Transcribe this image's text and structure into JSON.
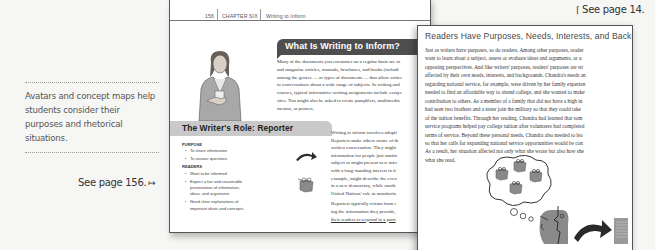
{
  "margin_notes": {
    "caption": "Avatars and concept maps help students consider their purposes and rhetorical situations.",
    "see_page_156": "See page 156.",
    "see_page_156_arrow": "↦",
    "see_page_14": "See page 14.",
    "see_page_14_arrow": "⌈"
  },
  "page156": {
    "running_head": {
      "page_number": "156",
      "chapter": "CHAPTER SIX",
      "title": "Writing to Inform"
    },
    "section_heading": "What Is Writing to Inform?",
    "intro_lines": [
      "Many of the documents you encounter on a regular basis are in",
      "and magazine articles, manuals, brochures, and books (includi",
      "among the genres — or types of documents — that allow writer",
      "to conversations about a wide range of subjects. In writing and",
      "courses, typical informative-writing assignments include essays",
      "sites. You might also be asked to create pamphlets, multimedia",
      "memos, or posters."
    ],
    "role_box": {
      "title": "The Writer's Role: Reporter",
      "purpose_heading": "PURPOSE",
      "purpose_items": [
        "To share information",
        "To answer questions"
      ],
      "readers_heading": "READERS",
      "readers_items": [
        "Want to be informed",
        "Expect a fair and reasonable presentation of information, ideas, and arguments",
        "Need clear explanations of important ideas and concepts"
      ]
    },
    "right_column": {
      "para1": [
        "Writing to inform involves adopti",
        "Reporters make others aware of th",
        "written conversation. They might",
        "information for people just startin",
        "subject or might present new info",
        "with a long-standing interest in it",
        "example, might describe the even",
        "in a new democracy, while anoth",
        "United Nations' role in monitorin"
      ],
      "para2": [
        "Reporters typically refrain from i",
        "ing the information they provide,",
        "their readers to respond in a parti"
      ]
    }
  },
  "overlay_page": {
    "heading": "Readers Have Purposes, Needs, Interests, and Backg",
    "body_lines": [
      "Just as writers have purposes, so do readers. Among other purposes, reader",
      "want to learn about a subject, assess or evaluate ideas and arguments, or u",
      "opposing perspectives. And like writers' purposes, readers' purposes are str",
      "affected by their own needs, interests, and backgrounds. Chandra's needs an",
      "regarding national service, for example, were driven by her family experien",
      "needed to find an affordable way to attend college, and she wanted to make",
      "contribution to others. As a member of a family that did not have a high in",
      "had seen two brothers and a sister join the military so that they could take",
      "of the tuition benefits. Through her reading, Chandra had learned that som",
      "service programs helped pay college tuition after volunteers had completed",
      "terms of service. Beyond these personal needs, Chandra also needed to lea",
      "so that her calls for expanding national service opportunities would be con",
      "As a result, her situation affected not only what she wrote but also how she",
      "what she read."
    ]
  },
  "colors": {
    "background": "#f6f6f4",
    "banner_dark": "#4e4e4e",
    "role_bar": "#c9c9c9",
    "icon_gray": "#8a8a8a"
  }
}
